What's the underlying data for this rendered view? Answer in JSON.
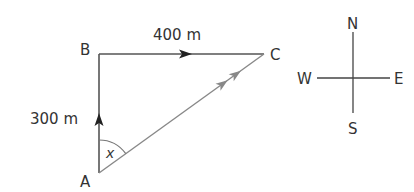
{
  "diagram": {
    "type": "vector-displacement",
    "points": {
      "A": {
        "label": "A"
      },
      "B": {
        "label": "B"
      },
      "C": {
        "label": "C"
      }
    },
    "segments": [
      {
        "name": "AB",
        "from": "A",
        "to": "B",
        "length_label": "300 m",
        "direction": "north",
        "arrows": 1
      },
      {
        "name": "BC",
        "from": "B",
        "to": "C",
        "length_label": "400 m",
        "direction": "east",
        "arrows": 1
      },
      {
        "name": "AC",
        "from": "A",
        "to": "C",
        "length_label": "",
        "direction": "resultant",
        "arrows": 2
      }
    ],
    "angle": {
      "vertex": "A",
      "label": "x"
    },
    "compass": {
      "north": "N",
      "south": "S",
      "east": "E",
      "west": "W"
    },
    "colors": {
      "path_line": "#555555",
      "resultant_line": "#888888",
      "text": "#333333"
    }
  }
}
